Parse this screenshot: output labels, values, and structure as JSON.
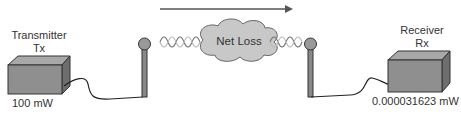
{
  "transmitter": {
    "title": "Transmitter",
    "abbr": "Tx",
    "power": "100 mW"
  },
  "receiver": {
    "title": "Receiver",
    "abbr": "Rx",
    "power": "0.000031623 mW"
  },
  "channel": {
    "label": "Net Loss",
    "direction": "left-to-right"
  },
  "colors": {
    "box": "#8f8f8f",
    "box_top": "#a8a8a8",
    "box_side": "#6e6e6e",
    "cloud": "#c8c8c8",
    "arrow": "#555555"
  }
}
